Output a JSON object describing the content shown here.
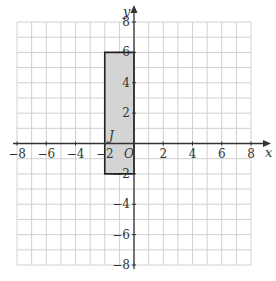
{
  "diagram": {
    "type": "coordinate-grid",
    "x_range": [
      -8,
      8
    ],
    "y_range": [
      -8,
      8
    ],
    "grid_step": 1,
    "x_axis_label": "x",
    "y_axis_label": "y",
    "origin_label": "O",
    "x_tick_labels": [
      "−8",
      "−6",
      "−4",
      "−2",
      "2",
      "4",
      "6",
      "8"
    ],
    "x_tick_values": [
      -8,
      -6,
      -4,
      -2,
      2,
      4,
      6,
      8
    ],
    "y_tick_labels": [
      "8",
      "6",
      "4",
      "2",
      "−2",
      "−4",
      "−6",
      "−8"
    ],
    "y_tick_values": [
      8,
      6,
      4,
      2,
      -2,
      -4,
      -6,
      -8
    ],
    "shape": {
      "name": "J",
      "kind": "rectangle",
      "vertices": [
        [
          -2,
          6
        ],
        [
          0,
          6
        ],
        [
          0,
          -2
        ],
        [
          -2,
          -2
        ]
      ],
      "fill": "#d4d4d4",
      "stroke": "#222222",
      "label_position": [
        -1.5,
        0.5
      ]
    },
    "colors": {
      "grid": "#d0d0d0",
      "axis": "#333333",
      "text": "#333333"
    }
  }
}
